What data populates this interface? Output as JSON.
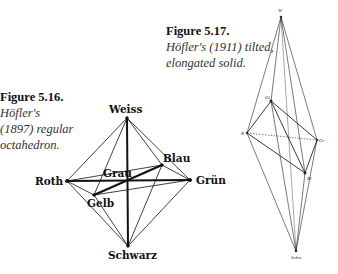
{
  "figure_516": {
    "title": "Figure 5.16.",
    "caption_lines": [
      "Höfler's",
      "(1897)  regular",
      "octahedron."
    ],
    "vertices": {
      "weiss": {
        "label": "Weiss",
        "x": 127,
        "y": 118
      },
      "schwarz": {
        "label": "Schwarz",
        "x": 128,
        "y": 246
      },
      "roth": {
        "label": "Roth",
        "x": 67,
        "y": 181
      },
      "gruen": {
        "label": "Grün",
        "x": 190,
        "y": 180
      },
      "blau": {
        "label": "Blau",
        "x": 162,
        "y": 165
      },
      "gelb": {
        "label": "Gelb",
        "x": 94,
        "y": 195
      },
      "grau": {
        "label": "Grau",
        "x": 128,
        "y": 181
      }
    }
  },
  "figure_517": {
    "title": "Figure 5.17.",
    "caption_lines": [
      "Höfler's (1911) tilted,",
      "elongated solid."
    ],
    "vertices": {
      "w": {
        "label": "W",
        "x": 281,
        "y": 17
      },
      "gt": {
        "label": "Gt",
        "x": 271,
        "y": 101
      },
      "r": {
        "label": "R",
        "x": 247,
        "y": 133
      },
      "gr": {
        "label": "Gr",
        "x": 317,
        "y": 140
      },
      "bl": {
        "label": "Bl",
        "x": 305,
        "y": 173
      },
      "schw": {
        "label": "Schw",
        "x": 296,
        "y": 251
      }
    }
  }
}
